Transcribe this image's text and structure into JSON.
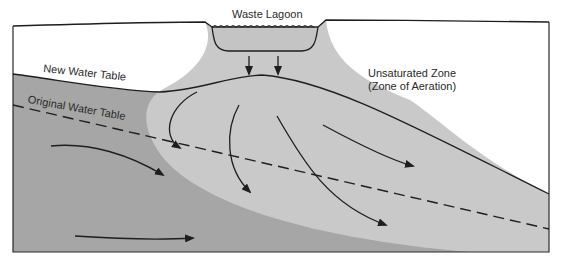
{
  "diagram": {
    "labels": {
      "waste_lagoon": "Waste Lagoon",
      "new_water_table": "New Water Table",
      "original_water_table": "Original Water Table",
      "unsaturated_zone": "Unsaturated Zone",
      "zone_of_aeration": "(Zone of Aeration)"
    },
    "zones": [
      {
        "name": "unsaturated-zone",
        "color": "#ffffff"
      },
      {
        "name": "contaminant-plume",
        "color": "#c9c9c9"
      },
      {
        "name": "saturated-zone",
        "color": "#a6a6a6"
      },
      {
        "name": "lagoon-water",
        "color": "#c9c9c9"
      }
    ],
    "line_color": "#1e1e1e",
    "flow_arrows": {
      "seepage_down": 2,
      "plume_flow": 4,
      "groundwater_flow": 2
    }
  }
}
